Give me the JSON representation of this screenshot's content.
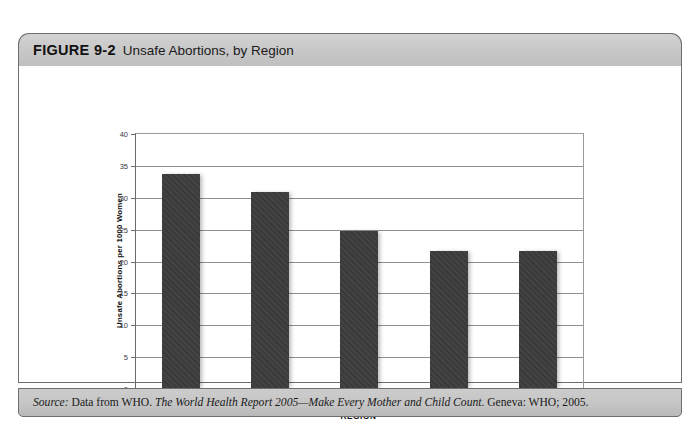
{
  "figure": {
    "number_label": "FIGURE 9-2",
    "title": "Unsafe Abortions, by Region"
  },
  "source": {
    "label": "Source:",
    "pre_italic": " Data from WHO. ",
    "italic_title": "The World Health Report 2005—Make Every Mother and Child Count.",
    "post_italic": " Geneva: WHO; 2005."
  },
  "colors": {
    "bar": "#3c3c3c",
    "header_band": "#c9c9c9",
    "source_band": "#c4c4c4",
    "frame_border": "#6e6e6e",
    "gridline": "#8f8f8f"
  },
  "chart_data": {
    "type": "bar",
    "title": "Unsafe Abortions, by Region",
    "xlabel": "REGION",
    "ylabel": "Unsafe Abortions per 1000 Women",
    "categories": [
      "South America",
      "Eastern Africa",
      "Western Africa",
      "Central Africa",
      "South Asia"
    ],
    "values": [
      33.8,
      30.9,
      24.8,
      21.7,
      21.6
    ],
    "ylim": [
      0,
      40
    ],
    "yticks": [
      0,
      5,
      10,
      15,
      20,
      25,
      30,
      35,
      40
    ],
    "ytick_labels": [
      "0",
      "5",
      "10",
      "15",
      "20",
      "25",
      "30",
      "35",
      "40"
    ],
    "grid": true,
    "legend": "none",
    "series": [
      {
        "name": "Unsafe abortions per 1000 women",
        "values": [
          33.8,
          30.9,
          24.8,
          21.7,
          21.6
        ]
      }
    ]
  }
}
